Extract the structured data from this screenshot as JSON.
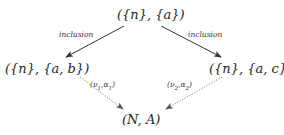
{
  "diagram": {
    "nodes": {
      "top": "({n}, {a})",
      "left": "({n}, {a, b})",
      "right": "({n}, {a, c})",
      "bottom": "(N, A)"
    },
    "edges": [
      {
        "from": "top",
        "to": "left",
        "label": "inclusion",
        "style": "solid"
      },
      {
        "from": "top",
        "to": "right",
        "label": "inclusion",
        "style": "solid"
      },
      {
        "from": "left",
        "to": "bottom",
        "label": "(ν1,α1)",
        "style": "dotted"
      },
      {
        "from": "right",
        "to": "bottom",
        "label": "(ν2,α2)",
        "style": "dotted"
      }
    ],
    "labels": {
      "left_inclusion": "inclusion",
      "right_inclusion": "inclusion",
      "nu1": "ν",
      "nu1_sub": "1",
      "alpha1": "α",
      "alpha1_sub": "1",
      "nu2": "ν",
      "nu2_sub": "2",
      "alpha2": "α",
      "alpha2_sub": "2"
    },
    "colors": {
      "solid_edge": "#333333",
      "dotted_edge": "#666666",
      "text": "#1e1e1e"
    }
  }
}
